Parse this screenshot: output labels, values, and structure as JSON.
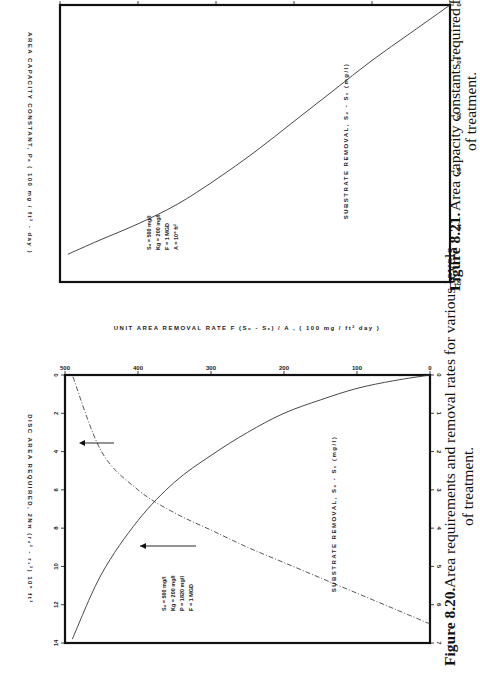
{
  "page": {
    "orientation": "rotated 90 degrees counter-clockwise"
  },
  "figures": [
    {
      "id": "fig-8-20",
      "caption_number": "Figure 8.20.",
      "caption_line1": "Area requirements and removal rates for various levels",
      "caption_line2": "of treatment.",
      "x_axis_label": "SUBSTRATE   REMOVAL,  S₀ - Sₑ (mg/l)",
      "y_left_label": "DISC   AREA   REQUIRED,  2Nπ (r₂² - r₁²)  10⁶ ft²",
      "y_right_label": "UNIT  AREA  REMOVAL  RATE   F (S₀ - Sₑ) / A , ( 100 mg / ft² day )",
      "x_ticks": [
        "0",
        "100",
        "200",
        "300",
        "400",
        "500"
      ],
      "y_left_ticks": [
        "0",
        "1",
        "2",
        "3",
        "4",
        "5",
        "6",
        "7"
      ],
      "y_right_ticks": [
        "0",
        "2",
        "4",
        "6",
        "8",
        "10",
        "12",
        "14"
      ],
      "legend": [
        "S₀ = 500 mg/l",
        "Kg = 200 mg/l",
        "P = 1820 mg/l",
        "F = 1 MGD"
      ]
    },
    {
      "id": "fig-8-21",
      "caption_number": "Figure 8.21.",
      "caption_line1": "Area capacity constants required for various levels",
      "caption_line2": "of treatment.",
      "x_axis_label": "SUBSTRATE   REMOVAL,  S₀ - Sₑ (mg/l)",
      "y_label": "AREA   CAPACITY   CONSTANT,  Pₐ ( 100 mg / ft² - day )",
      "x_ticks": [
        "0",
        "100",
        "200",
        "300",
        "400",
        "500"
      ],
      "y_ticks": [
        "0",
        "10",
        "20",
        "30",
        "40",
        "50"
      ],
      "legend": [
        "S₀ = 500 mg/l",
        "Kg = 200 mg/l",
        "F = 1 MGD",
        "A = 10⁶ ft²"
      ]
    }
  ],
  "chart_data": [
    {
      "type": "line",
      "title": "Figure 8.20. Area requirements and removal rates for various levels of treatment.",
      "xlabel": "Substrate removal, S0 - Se (mg/l)",
      "ylabel": "Disc area required (10^6 ft^2) [left]; Unit area removal rate (100 mg/ft^2 day) [right]",
      "xlim": [
        0,
        500
      ],
      "ylim_left": [
        0,
        7
      ],
      "ylim_right": [
        0,
        14
      ],
      "grid": false,
      "x": [
        0,
        50,
        100,
        150,
        200,
        250,
        300,
        350,
        400,
        450,
        490
      ],
      "series": [
        {
          "name": "Disc area required (solid, left axis)",
          "axis": "left",
          "style": "solid",
          "values": [
            0.0,
            0.15,
            0.35,
            0.65,
            1.0,
            1.5,
            2.1,
            2.8,
            3.8,
            5.2,
            6.9
          ]
        },
        {
          "name": "Unit area removal rate (dash-dot, right axis)",
          "axis": "right",
          "style": "dash-dot",
          "values": [
            13.0,
            12.2,
            11.4,
            10.6,
            9.8,
            9.0,
            8.1,
            7.2,
            6.0,
            4.0,
            0.0
          ]
        }
      ],
      "annotations": [
        "arrow pointing to right axis on dash-dot curve",
        "arrow pointing to left axis on solid curve",
        "S0 = 500 mg/l",
        "Kg = 200 mg/l",
        "P = 1820 mg/l",
        "F = 1 MGD"
      ]
    },
    {
      "type": "line",
      "title": "Figure 8.21. Area capacity constants required for various levels of treatment.",
      "xlabel": "Substrate removal, S0 - Se (mg/l)",
      "ylabel": "Area capacity constant, Pa (100 mg/ft^2 - day)",
      "xlim": [
        0,
        500
      ],
      "ylim": [
        0,
        50
      ],
      "grid": false,
      "x": [
        0,
        50,
        100,
        150,
        200,
        250,
        300,
        350,
        400,
        450,
        490
      ],
      "series": [
        {
          "name": "Area capacity constant",
          "style": "solid",
          "values": [
            0.0,
            5.0,
            10.0,
            15.5,
            21.0,
            26.5,
            31.5,
            36.0,
            39.5,
            42.5,
            45.0
          ]
        }
      ],
      "annotations": [
        "S0 = 500 mg/l",
        "Kg = 200 mg/l",
        "F = 1 MGD",
        "A = 10^6 ft^2"
      ]
    }
  ]
}
